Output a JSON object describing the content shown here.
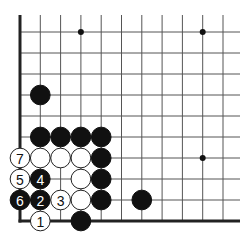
{
  "diagram": {
    "type": "go-board-fragment",
    "corner": "bottom-left",
    "grid": {
      "columns": 11,
      "rows": 10,
      "origin_x": 20,
      "origin_y": 32,
      "spacing_x": 20.3,
      "spacing_y": 21,
      "top_extension": 17,
      "right_extension": 17
    },
    "edges": [
      "left",
      "bottom"
    ],
    "star_points": [
      {
        "col": 3,
        "row": 0
      },
      {
        "col": 9,
        "row": 0
      },
      {
        "col": 9,
        "row": 6
      }
    ],
    "stones": [
      {
        "col": 1,
        "row": 3,
        "color": "black",
        "label": ""
      },
      {
        "col": 1,
        "row": 5,
        "color": "black",
        "label": ""
      },
      {
        "col": 2,
        "row": 5,
        "color": "black",
        "label": ""
      },
      {
        "col": 3,
        "row": 5,
        "color": "black",
        "label": ""
      },
      {
        "col": 4,
        "row": 5,
        "color": "black",
        "label": ""
      },
      {
        "col": 0,
        "row": 6,
        "color": "white",
        "label": "7"
      },
      {
        "col": 1,
        "row": 6,
        "color": "white",
        "label": ""
      },
      {
        "col": 2,
        "row": 6,
        "color": "white",
        "label": ""
      },
      {
        "col": 3,
        "row": 6,
        "color": "white",
        "label": ""
      },
      {
        "col": 4,
        "row": 6,
        "color": "black",
        "label": ""
      },
      {
        "col": 0,
        "row": 7,
        "color": "white",
        "label": "5"
      },
      {
        "col": 1,
        "row": 7,
        "color": "black",
        "label": "4"
      },
      {
        "col": 3,
        "row": 7,
        "color": "white",
        "label": ""
      },
      {
        "col": 4,
        "row": 7,
        "color": "black",
        "label": ""
      },
      {
        "col": 0,
        "row": 8,
        "color": "black",
        "label": "6"
      },
      {
        "col": 1,
        "row": 8,
        "color": "black",
        "label": "2"
      },
      {
        "col": 2,
        "row": 8,
        "color": "white",
        "label": "3"
      },
      {
        "col": 3,
        "row": 8,
        "color": "white",
        "label": ""
      },
      {
        "col": 4,
        "row": 8,
        "color": "black",
        "label": ""
      },
      {
        "col": 6,
        "row": 8,
        "color": "black",
        "label": ""
      },
      {
        "col": 1,
        "row": 9,
        "color": "white",
        "label": "1"
      },
      {
        "col": 3,
        "row": 9,
        "color": "black",
        "label": ""
      }
    ],
    "colors": {
      "background": "#ffffff",
      "line": "#555555",
      "edge": "#222222",
      "black_stone": "#111111",
      "white_stone": "#ffffff"
    }
  }
}
